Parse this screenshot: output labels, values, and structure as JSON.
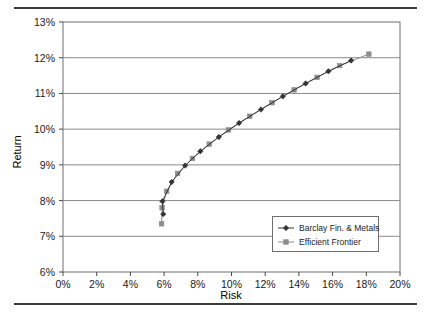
{
  "chart_data": {
    "type": "line",
    "title": "",
    "xlabel": "Risk",
    "ylabel": "Return",
    "xlim": [
      0,
      20
    ],
    "ylim": [
      6,
      13
    ],
    "xticks": [
      "0%",
      "2%",
      "4%",
      "6%",
      "8%",
      "10%",
      "12%",
      "14%",
      "16%",
      "18%",
      "20%"
    ],
    "xtick_values": [
      0,
      2,
      4,
      6,
      8,
      10,
      12,
      14,
      16,
      18,
      20
    ],
    "yticks": [
      "6%",
      "7%",
      "8%",
      "9%",
      "10%",
      "11%",
      "12%",
      "13%"
    ],
    "ytick_values": [
      6,
      7,
      8,
      9,
      10,
      11,
      12,
      13
    ],
    "grid": "horizontal",
    "legend_position": "inside-bottom-right",
    "series": [
      {
        "name": "Barclay Fin. & Metals",
        "marker": "diamond",
        "color": "#333333",
        "points": [
          [
            5.95,
            7.62
          ],
          [
            5.9,
            7.98
          ],
          [
            6.45,
            8.52
          ],
          [
            7.25,
            8.98
          ],
          [
            8.15,
            9.38
          ],
          [
            9.25,
            9.78
          ],
          [
            10.45,
            10.17
          ],
          [
            11.75,
            10.55
          ],
          [
            13.05,
            10.92
          ],
          [
            14.4,
            11.28
          ],
          [
            15.75,
            11.62
          ],
          [
            17.1,
            11.92
          ]
        ]
      },
      {
        "name": "Efficient Frontier",
        "marker": "square",
        "color": "#8c8c8c",
        "points": [
          [
            5.85,
            7.35
          ],
          [
            5.88,
            7.8
          ],
          [
            6.15,
            8.26
          ],
          [
            6.8,
            8.76
          ],
          [
            7.68,
            9.18
          ],
          [
            8.68,
            9.58
          ],
          [
            9.82,
            9.98
          ],
          [
            11.08,
            10.36
          ],
          [
            12.4,
            10.74
          ],
          [
            13.72,
            11.1
          ],
          [
            15.08,
            11.45
          ],
          [
            16.42,
            11.78
          ],
          [
            18.15,
            12.1
          ]
        ]
      }
    ]
  },
  "legend": {
    "items": [
      {
        "label": "Barclay Fin. & Metals",
        "marker": "diamond",
        "color": "#333333"
      },
      {
        "label": "Efficient Frontier",
        "marker": "square",
        "color": "#8c8c8c"
      }
    ]
  }
}
